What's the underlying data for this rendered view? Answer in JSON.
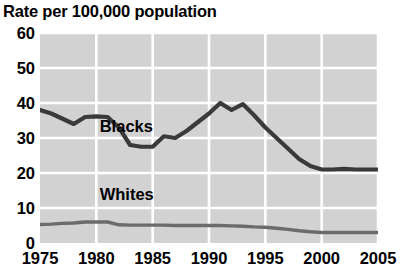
{
  "chart_data": {
    "type": "line",
    "title": "Rate per 100,000 population",
    "xlabel": "",
    "ylabel": "",
    "xlim": [
      1975,
      2005
    ],
    "ylim": [
      0,
      60
    ],
    "grid": true,
    "legend_position": "inline-labels",
    "x_ticks": [
      "1975",
      "1980",
      "1985",
      "1990",
      "1995",
      "2000",
      "2005"
    ],
    "y_ticks": [
      "0",
      "10",
      "20",
      "30",
      "40",
      "50",
      "60"
    ],
    "x": [
      1975,
      1976,
      1977,
      1978,
      1979,
      1980,
      1981,
      1982,
      1983,
      1984,
      1985,
      1986,
      1987,
      1988,
      1989,
      1990,
      1991,
      1992,
      1993,
      1994,
      1995,
      1996,
      1997,
      1998,
      1999,
      2000,
      2001,
      2002,
      2003,
      2004,
      2005
    ],
    "series": [
      {
        "name": "Blacks",
        "color": "#3a3a3a",
        "label_x": 1980.3,
        "label_y": 33.5,
        "values": [
          38.0,
          37.0,
          35.5,
          34.0,
          36.0,
          36.2,
          36.0,
          33.0,
          28.0,
          27.5,
          27.5,
          30.5,
          30.0,
          32.0,
          34.5,
          37.0,
          40.0,
          38.0,
          39.7,
          36.5,
          33.0,
          30.0,
          27.0,
          24.0,
          22.0,
          21.0,
          21.0,
          21.2,
          21.0,
          21.0,
          21.0
        ]
      },
      {
        "name": "Whites",
        "color": "#6b6b6b",
        "label_x": 1980.3,
        "label_y": 14.0,
        "values": [
          5.3,
          5.4,
          5.6,
          5.7,
          6.0,
          6.0,
          6.0,
          5.2,
          5.1,
          5.1,
          5.1,
          5.1,
          5.0,
          5.0,
          5.0,
          5.0,
          5.0,
          4.9,
          4.8,
          4.6,
          4.5,
          4.2,
          3.9,
          3.5,
          3.2,
          3.0,
          3.0,
          3.0,
          3.0,
          3.0,
          3.0
        ]
      }
    ]
  },
  "labels": {
    "blacks": "Blacks",
    "whites": "Whites"
  }
}
